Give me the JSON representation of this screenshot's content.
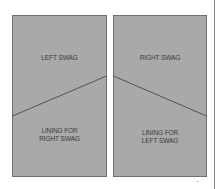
{
  "diagram": {
    "left_panel": {
      "top_label": "LEFT SWAG",
      "bottom_label_line1": "LINING FOR",
      "bottom_label_line2": "RIGHT SWAG"
    },
    "right_panel": {
      "top_label": "RIGHT SWAG",
      "bottom_label_line1": "LINING FOR",
      "bottom_label_line2": "LEFT SWAG"
    },
    "colors": {
      "panel_fill": "#a9a9a9",
      "panel_border": "#6e6e6e",
      "cut_line": "#3c3c3c",
      "text": "#3a3a3a"
    }
  }
}
